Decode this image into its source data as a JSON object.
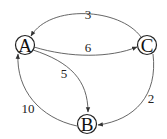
{
  "diagram": {
    "type": "directed-weighted-graph",
    "nodes": [
      {
        "id": "A",
        "label": "A"
      },
      {
        "id": "B",
        "label": "B"
      },
      {
        "id": "C",
        "label": "C"
      }
    ],
    "edges": [
      {
        "from": "C",
        "to": "A",
        "weight": "3"
      },
      {
        "from": "A",
        "to": "C",
        "weight": "6"
      },
      {
        "from": "A",
        "to": "B",
        "weight": "5"
      },
      {
        "from": "B",
        "to": "A",
        "weight": "10"
      },
      {
        "from": "C",
        "to": "B",
        "weight": "2"
      }
    ],
    "colors": {
      "edge": "#555555",
      "node_stroke": "#222222",
      "text": "#111111",
      "background": "#ffffff"
    }
  }
}
